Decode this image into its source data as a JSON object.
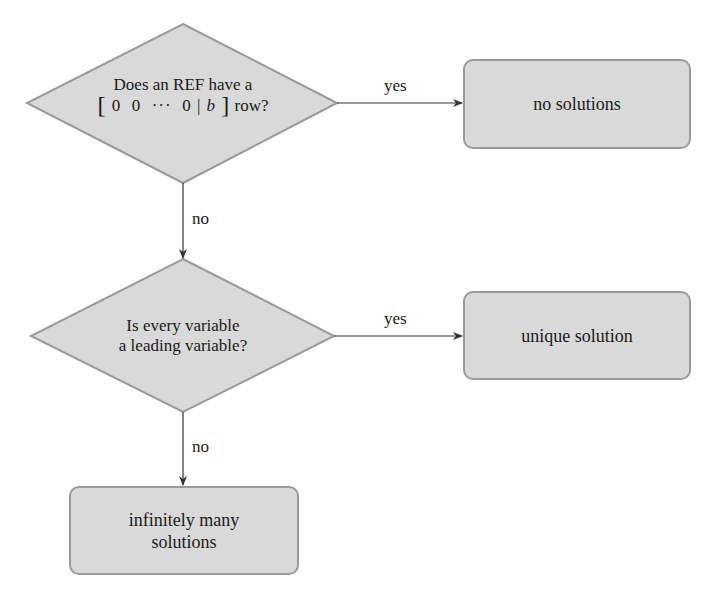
{
  "decisions": [
    {
      "id": "ref-zero-row",
      "line1": "Does an REF have a",
      "line2_math": {
        "bracket_open": "[",
        "entries": "0  0  ···  0",
        "sep": "|",
        "rhs": "b",
        "bracket_close": "]"
      },
      "line2_suffix": "row?"
    },
    {
      "id": "all-leading",
      "line1": "Is every variable",
      "line2": "a leading variable?"
    }
  ],
  "outcomes": [
    {
      "id": "no-solutions",
      "line1": "no solutions"
    },
    {
      "id": "unique-solution",
      "line1": "unique solution"
    },
    {
      "id": "infinitely-many",
      "line1": "infinitely many",
      "line2": "solutions"
    }
  ],
  "edges": [
    {
      "from": "ref-zero-row",
      "to": "no-solutions",
      "label": "yes"
    },
    {
      "from": "ref-zero-row",
      "to": "all-leading",
      "label": "no"
    },
    {
      "from": "all-leading",
      "to": "unique-solution",
      "label": "yes"
    },
    {
      "from": "all-leading",
      "to": "infinitely-many",
      "label": "no"
    }
  ],
  "colors": {
    "fill": "#d9d9d9",
    "stroke": "#9a9a9a",
    "arrow": "#333333"
  }
}
